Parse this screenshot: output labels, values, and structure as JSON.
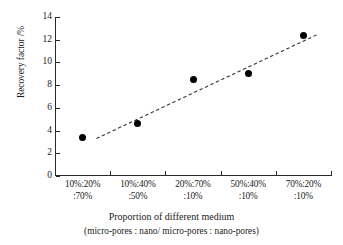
{
  "chart_data": {
    "type": "scatter",
    "title": "",
    "subtitle": "",
    "xlabel": "Proportion of different medium",
    "xlabel_sub": "(micro-pores : nano/ micro-pores : nano-pores)",
    "ylabel": "Recovery factor /%",
    "categories": [
      "10%:20%:70%",
      "10%:40%:50%",
      "20%:70%:10%",
      "50%:40%:10%",
      "70%:20%:10%"
    ],
    "category_lines": [
      {
        "line1": "10%:20%",
        "line2": ":70%"
      },
      {
        "line1": "10%:40%",
        "line2": ":50%"
      },
      {
        "line1": "20%:70%",
        "line2": ":10%"
      },
      {
        "line1": "50%:40%",
        "line2": ":10%"
      },
      {
        "line1": "70%:20%",
        "line2": ":10%"
      }
    ],
    "values": [
      3.4,
      4.6,
      8.5,
      9.0,
      12.4
    ],
    "ylim": [
      0,
      14
    ],
    "ytick_values": [
      0,
      2,
      4,
      6,
      8,
      10,
      12,
      14
    ],
    "ytick_labels": [
      "0",
      "2",
      "4",
      "6",
      "8",
      "10",
      "12",
      "14"
    ],
    "grid": false,
    "legend": "none",
    "marker": {
      "shape": "circle",
      "color": "#000000",
      "size": 7
    },
    "trendline": {
      "style": "dashed",
      "color": "#333333",
      "x_start": 0.25,
      "y_start": 3.3,
      "x_end": 4.25,
      "y_end": 12.45
    },
    "axis_color": "#2a2a2a",
    "background": "#ffffff"
  }
}
